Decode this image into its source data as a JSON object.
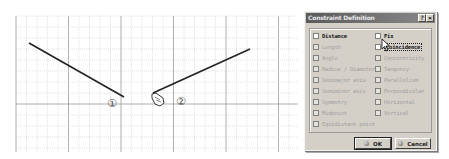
{
  "viewport": {
    "markers": [
      {
        "name": "marker-1",
        "label": "①"
      },
      {
        "name": "marker-2",
        "label": "②"
      }
    ],
    "lines": [
      {
        "name": "line-1",
        "description": "selected line segment 1"
      },
      {
        "name": "line-2",
        "description": "selected line segment 2"
      }
    ]
  },
  "dialog": {
    "title": "Constraint Definition",
    "help_label": "?",
    "close_label": "×",
    "left_options": [
      {
        "label": "Distance",
        "enabled": true,
        "checked": false
      },
      {
        "label": "Length",
        "enabled": false,
        "checked": false
      },
      {
        "label": "Angle",
        "enabled": false,
        "checked": false
      },
      {
        "label": "Radius / Diameter",
        "enabled": false,
        "checked": false
      },
      {
        "label": "Semimajor axis",
        "enabled": false,
        "checked": false
      },
      {
        "label": "Semiminor axis",
        "enabled": false,
        "checked": false
      },
      {
        "label": "Symmetry",
        "enabled": false,
        "checked": false
      },
      {
        "label": "Midpoint",
        "enabled": false,
        "checked": false
      },
      {
        "label": "Equidistant point",
        "enabled": false,
        "checked": false
      }
    ],
    "right_options": [
      {
        "label": "Fix",
        "enabled": true,
        "checked": false
      },
      {
        "label": "Coincidence",
        "enabled": true,
        "checked": false,
        "focused": true
      },
      {
        "label": "Concentricity",
        "enabled": false,
        "checked": false
      },
      {
        "label": "Tangency",
        "enabled": false,
        "checked": false
      },
      {
        "label": "Parallelism",
        "enabled": false,
        "checked": false
      },
      {
        "label": "Perpendicular",
        "enabled": false,
        "checked": false
      },
      {
        "label": "Horizontal",
        "enabled": false,
        "checked": false
      },
      {
        "label": "Vertical",
        "enabled": false,
        "checked": false
      }
    ],
    "ok_label": "OK",
    "cancel_label": "Cancel"
  }
}
